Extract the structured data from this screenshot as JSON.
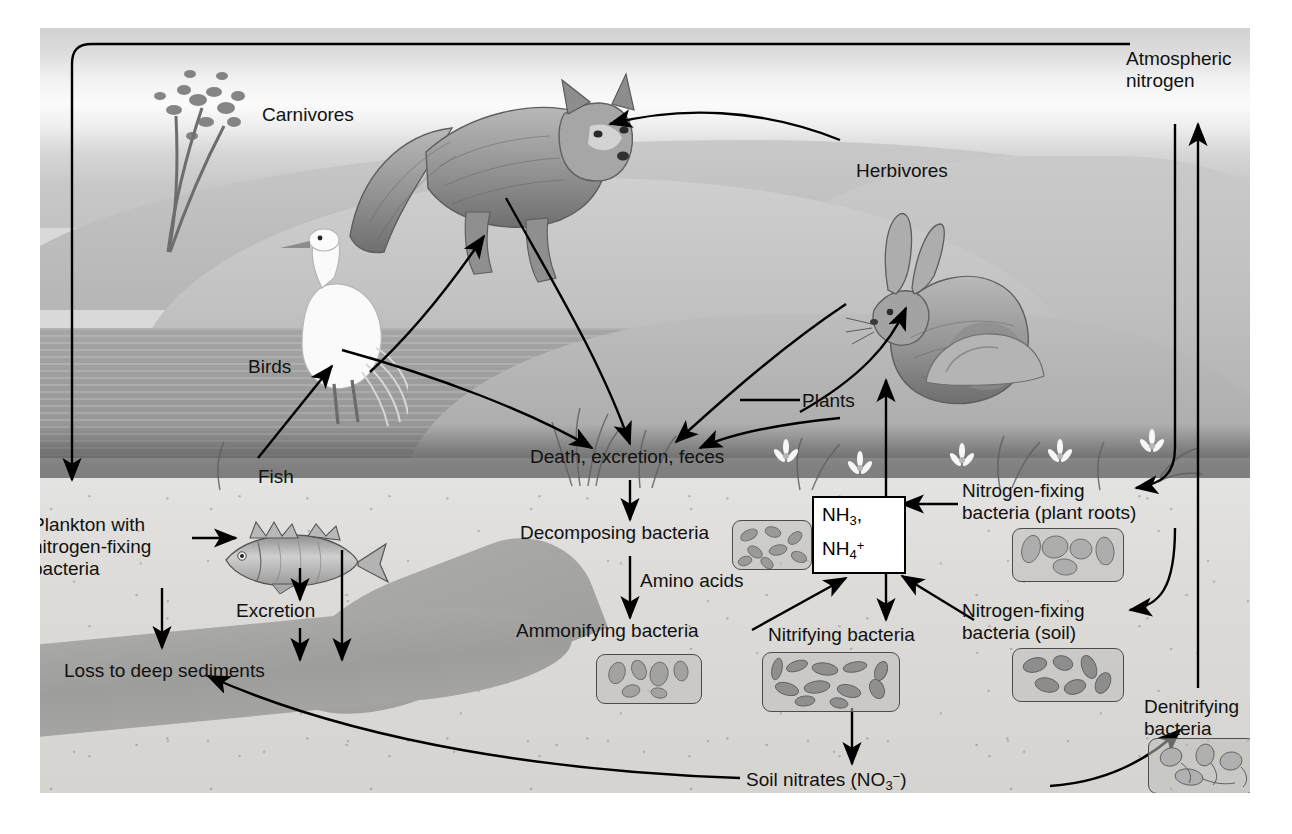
{
  "figure": {
    "background_color": "#d9d9d9",
    "ink_color": "#000000"
  },
  "scene_labels": {
    "carnivores": "Carnivores",
    "herbivores": "Herbivores",
    "birds": "Birds",
    "fish": "Fish",
    "plants": "Plants",
    "atmospheric_nitrogen": "Atmospheric\nnitrogen",
    "death_excretion_feces": "Death, excretion, feces"
  },
  "aquatic_labels": {
    "plankton": "Plankton with\nnitrogen-fixing\nbacteria",
    "excretion": "Excretion",
    "loss_to_sediments": "Loss to deep sediments"
  },
  "soil_labels": {
    "decomposing_bacteria": "Decomposing bacteria",
    "amino_acids": "Amino acids",
    "ammonifying_bacteria": "Ammonifying bacteria",
    "nitrifying_bacteria": "Nitrifying bacteria",
    "nfix_roots": "Nitrogen-fixing\nbacteria (plant roots)",
    "nfix_soil": "Nitrogen-fixing\nbacteria (soil)",
    "denitrifying_bacteria": "Denitrifying\nbacteria",
    "soil_nitrates_prefix": "Soil nitrates (NO",
    "soil_nitrates_sub": "3",
    "soil_nitrates_sup": "−",
    "soil_nitrates_suffix": ")"
  },
  "ammonia_box": {
    "line1_prefix": "NH",
    "line1_sub": "3",
    "line1_suffix": ",",
    "line2_prefix": "NH",
    "line2_sub": "4",
    "line2_sup": "+",
    "border_color": "#000000",
    "fill_color": "#ffffff"
  },
  "bacteria_boxes": [
    {
      "id": "decomposing",
      "name": "decomposing-bacteria-micrograph",
      "shape": "rods",
      "count": 8
    },
    {
      "id": "ammonifying",
      "name": "ammonifying-bacteria-micrograph",
      "shape": "ovals",
      "count": 6
    },
    {
      "id": "nitrifying",
      "name": "nitrifying-bacteria-micrograph",
      "shape": "rods",
      "count": 11
    },
    {
      "id": "nfix-roots",
      "name": "nitrogen-fixing-root-bacteria-micrograph",
      "shape": "large-ovals",
      "count": 5
    },
    {
      "id": "nfix-soil",
      "name": "nitrogen-fixing-soil-bacteria-micrograph",
      "shape": "rods",
      "count": 6
    },
    {
      "id": "denitrifying",
      "name": "denitrifying-bacteria-micrograph",
      "shape": "flagellates",
      "count": 4
    }
  ],
  "organisms": [
    {
      "id": "fox",
      "name": "fox-illustration",
      "role": "Carnivores"
    },
    {
      "id": "rabbit",
      "name": "rabbit-illustration",
      "role": "Herbivores"
    },
    {
      "id": "egret",
      "name": "egret-illustration",
      "role": "Birds"
    },
    {
      "id": "perch",
      "name": "fish-illustration",
      "role": "Fish"
    }
  ],
  "flows": [
    {
      "from": "Atmospheric nitrogen",
      "to": "Plankton with nitrogen-fixing bacteria"
    },
    {
      "from": "Herbivores",
      "to": "Carnivores"
    },
    {
      "from": "Fish",
      "to": "Birds"
    },
    {
      "from": "Birds",
      "to": "Carnivores"
    },
    {
      "from": "Carnivores",
      "to": "Death, excretion, feces"
    },
    {
      "from": "Herbivores",
      "to": "Death, excretion, feces"
    },
    {
      "from": "Birds",
      "to": "Death, excretion, feces"
    },
    {
      "from": "Plants",
      "to": "Death, excretion, feces"
    },
    {
      "from": "Plants",
      "to": "Herbivores"
    },
    {
      "from": "Death, excretion, feces",
      "to": "Decomposing bacteria"
    },
    {
      "from": "Decomposing bacteria",
      "to": "Ammonifying bacteria",
      "label": "Amino acids"
    },
    {
      "from": "Ammonifying bacteria",
      "to": "NH3, NH4+"
    },
    {
      "from": "Nitrogen-fixing bacteria (soil)",
      "to": "NH3, NH4+"
    },
    {
      "from": "Nitrogen-fixing bacteria (plant roots)",
      "to": "NH3, NH4+"
    },
    {
      "from": "NH3, NH4+",
      "to": "Plants"
    },
    {
      "from": "NH3, NH4+",
      "to": "Nitrifying bacteria"
    },
    {
      "from": "Nitrifying bacteria",
      "to": "Soil nitrates (NO3-)"
    },
    {
      "from": "Soil nitrates (NO3-)",
      "to": "Denitrifying bacteria"
    },
    {
      "from": "Soil nitrates (NO3-)",
      "to": "Loss to deep sediments"
    },
    {
      "from": "Denitrifying bacteria",
      "to": "Atmospheric nitrogen"
    },
    {
      "from": "Atmospheric nitrogen",
      "to": "Nitrogen-fixing bacteria (plant roots)"
    },
    {
      "from": "Atmospheric nitrogen",
      "to": "Nitrogen-fixing bacteria (soil)"
    },
    {
      "from": "Plankton with nitrogen-fixing bacteria",
      "to": "Fish"
    },
    {
      "from": "Plankton with nitrogen-fixing bacteria",
      "to": "Loss to deep sediments"
    },
    {
      "from": "Fish",
      "to": "Excretion"
    },
    {
      "from": "Excretion",
      "to": "Loss to deep sediments"
    },
    {
      "from": "Fish",
      "to": "Loss to deep sediments"
    }
  ]
}
